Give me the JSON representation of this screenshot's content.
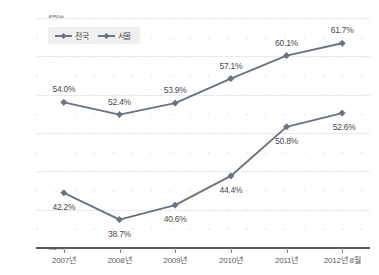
{
  "chart_data": {
    "type": "line",
    "title": "",
    "subtitle": "",
    "xlabel": "",
    "ylabel": "",
    "categories": [
      "2007년",
      "2008년",
      "2009년",
      "2010년",
      "2011년",
      "2012년 8월"
    ],
    "series": [
      {
        "name": "전국",
        "values": [
          54.0,
          52.4,
          53.9,
          57.1,
          60.1,
          61.7
        ],
        "labels": [
          "54.0%",
          "52.4%",
          "53.9%",
          "57.1%",
          "60.1%",
          "61.7%"
        ],
        "color": "#6b7280",
        "marker": "diamond",
        "label_positions": [
          "above",
          "above",
          "above",
          "above",
          "above",
          "above"
        ]
      },
      {
        "name": "서울",
        "values": [
          42.2,
          38.7,
          40.6,
          44.4,
          50.8,
          52.6
        ],
        "labels": [
          "42.2%",
          "38.7%",
          "40.6%",
          "44.4%",
          "50.8%",
          "52.6%"
        ],
        "color": "#6b7280",
        "marker": "diamond",
        "label_positions": [
          "below",
          "below",
          "below",
          "below",
          "below",
          "above-right"
        ]
      }
    ],
    "ylim": [
      35,
      65
    ],
    "ytick_values": [
      65,
      60,
      55,
      50,
      45,
      40,
      35
    ],
    "ytick_labels": [
      "65%",
      "60%",
      "55%",
      "50%",
      "45%",
      "40%",
      "35%"
    ],
    "grid": true,
    "grid_style": "dotted-matrix-with-horizontal-lines",
    "legend_position": "top-left",
    "axis_baseline_value": 35,
    "accent_color": "#6b7280",
    "gridline_color": "#e9ebee",
    "baseline_color": "#555a60",
    "background_color": "#ffffff"
  }
}
